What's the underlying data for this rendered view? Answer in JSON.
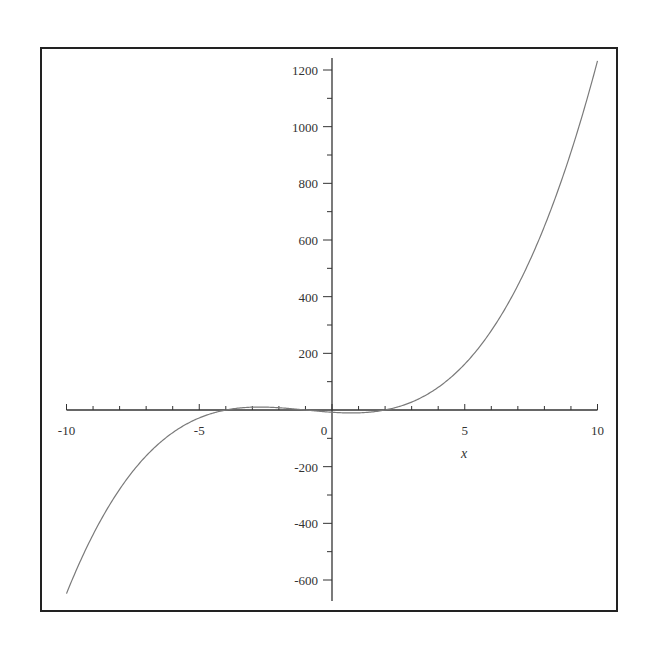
{
  "chart_data": {
    "type": "line",
    "title": "",
    "xlabel": "x",
    "ylabel": "",
    "xlim": [
      -10,
      10
    ],
    "ylim": [
      -650,
      1250
    ],
    "function": "(x+4)(x+1)(x-2)",
    "x_ticks": [
      -10,
      -5,
      0,
      5,
      10
    ],
    "x_tick_labels": [
      "-10",
      "-5",
      "0",
      "5",
      "10"
    ],
    "y_ticks": [
      -600,
      -400,
      -200,
      200,
      400,
      600,
      800,
      1000,
      1200
    ],
    "y_tick_labels": [
      "-600",
      "-400",
      "-200",
      "200",
      "400",
      "600",
      "800",
      "1000",
      "1200"
    ],
    "grid": false,
    "legend": null,
    "series": [
      {
        "name": "f(x)",
        "x": [
          -10,
          -9,
          -8,
          -7,
          -6,
          -5,
          -4,
          -3,
          -2,
          -1,
          0,
          1,
          2,
          3,
          4,
          5,
          6,
          7,
          8,
          9,
          10
        ],
        "values": [
          -648,
          -440,
          -280,
          -162,
          -80,
          -28,
          0,
          10,
          8,
          0,
          -8,
          -10,
          0,
          28,
          80,
          162,
          280,
          440,
          648,
          910,
          1232
        ]
      }
    ]
  },
  "colors": {
    "frame": "#222222",
    "axis": "#333333",
    "curve": "#7a7a7a"
  }
}
